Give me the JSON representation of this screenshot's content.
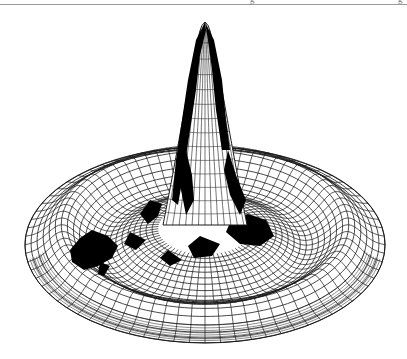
{
  "page": {
    "header_clipped_text_left": "g",
    "header_clipped_text_right": "g"
  },
  "figure": {
    "colors": {
      "background": "#ffffff",
      "mesh": "#1a1a1a",
      "fill": "#000000",
      "rule": "#9a9a9a"
    },
    "outer_ellipse": {
      "cx": 205,
      "cy": 245,
      "rx": 180,
      "ry": 98
    },
    "rim_ellipse": {
      "cx": 205,
      "cy": 228,
      "rx": 150,
      "ry": 78
    },
    "trough_ellipse": {
      "cx": 205,
      "cy": 222,
      "rx": 112,
      "ry": 55
    },
    "peak": {
      "apex_x": 205,
      "apex_y": 22,
      "base_y": 225,
      "base_half_width": 42
    },
    "radial_lines": 72,
    "ring_count": 22
  }
}
